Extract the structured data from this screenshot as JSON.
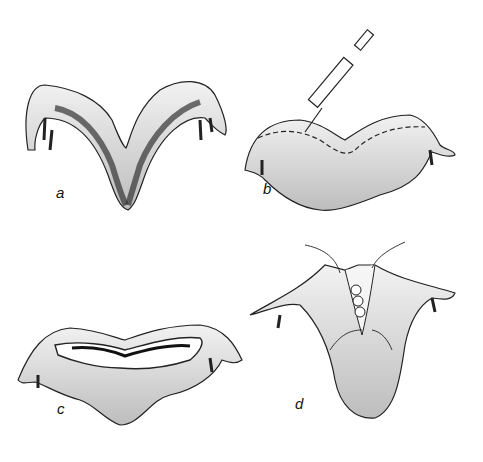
{
  "figure": {
    "panels": [
      {
        "id": "a",
        "label": "a",
        "description": "bicornuate uterus with dark septal/muscle bands"
      },
      {
        "id": "b",
        "label": "b",
        "description": "syringe injecting along dashed incision line"
      },
      {
        "id": "c",
        "label": "c",
        "description": "opened uterus showing layered incision cavity"
      },
      {
        "id": "d",
        "label": "d",
        "description": "closure with sutures at fundus"
      }
    ],
    "colors": {
      "ink": "#1a1a1a",
      "fill": "#e9e9e9",
      "shade": "#555555",
      "background": "#ffffff"
    }
  }
}
